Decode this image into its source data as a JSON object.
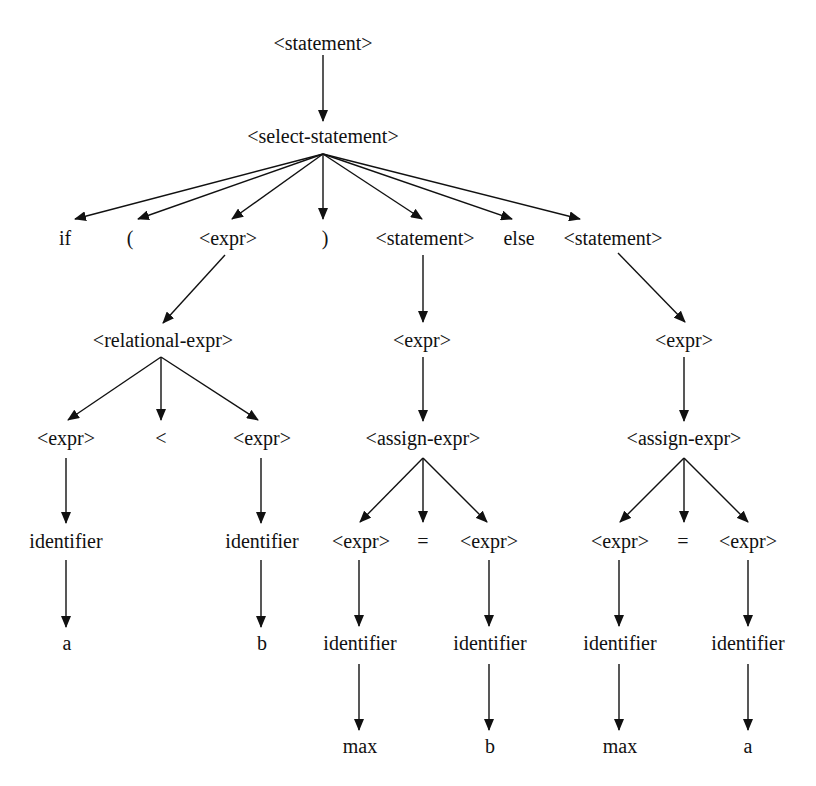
{
  "diagram": {
    "colors": {
      "line": "#111111",
      "text": "#111111",
      "background": "#ffffff"
    },
    "nodes": [
      {
        "id": "n0",
        "label": "<statement>",
        "x": 323,
        "y": 43
      },
      {
        "id": "n1",
        "label": "<select-statement>",
        "x": 323,
        "y": 136
      },
      {
        "id": "n2",
        "label": "if",
        "x": 65,
        "y": 238
      },
      {
        "id": "n3",
        "label": "(",
        "x": 130,
        "y": 238
      },
      {
        "id": "n4",
        "label": "<expr>",
        "x": 228,
        "y": 238
      },
      {
        "id": "n5",
        "label": ")",
        "x": 325,
        "y": 238
      },
      {
        "id": "n6",
        "label": "<statement>",
        "x": 425,
        "y": 238
      },
      {
        "id": "n7",
        "label": "else",
        "x": 519,
        "y": 238
      },
      {
        "id": "n8",
        "label": "<statement>",
        "x": 613,
        "y": 238
      },
      {
        "id": "n9",
        "label": "<relational-expr>",
        "x": 163,
        "y": 340
      },
      {
        "id": "n10",
        "label": "<expr>",
        "x": 422,
        "y": 340
      },
      {
        "id": "n11",
        "label": "<expr>",
        "x": 684,
        "y": 340
      },
      {
        "id": "n12",
        "label": "<expr>",
        "x": 66,
        "y": 438
      },
      {
        "id": "n13",
        "label": "<",
        "x": 161,
        "y": 438
      },
      {
        "id": "n14",
        "label": "<expr>",
        "x": 262,
        "y": 438
      },
      {
        "id": "n15",
        "label": "<assign-expr>",
        "x": 423,
        "y": 438
      },
      {
        "id": "n16",
        "label": "<assign-expr>",
        "x": 684,
        "y": 438
      },
      {
        "id": "n17",
        "label": "identifier",
        "x": 66,
        "y": 541
      },
      {
        "id": "n18",
        "label": "identifier",
        "x": 262,
        "y": 541
      },
      {
        "id": "n19",
        "label": "<expr>",
        "x": 361,
        "y": 541
      },
      {
        "id": "n20",
        "label": "=",
        "x": 423,
        "y": 541
      },
      {
        "id": "n21",
        "label": "<expr>",
        "x": 489,
        "y": 541
      },
      {
        "id": "n22",
        "label": "<expr>",
        "x": 620,
        "y": 541
      },
      {
        "id": "n23",
        "label": "=",
        "x": 683,
        "y": 541
      },
      {
        "id": "n24",
        "label": "<expr>",
        "x": 748,
        "y": 541
      },
      {
        "id": "n25",
        "label": "a",
        "x": 67,
        "y": 643
      },
      {
        "id": "n26",
        "label": "b",
        "x": 262,
        "y": 643
      },
      {
        "id": "n27",
        "label": "identifier",
        "x": 360,
        "y": 643
      },
      {
        "id": "n28",
        "label": "identifier",
        "x": 490,
        "y": 643
      },
      {
        "id": "n29",
        "label": "identifier",
        "x": 620,
        "y": 643
      },
      {
        "id": "n30",
        "label": "identifier",
        "x": 748,
        "y": 643
      },
      {
        "id": "n31",
        "label": "max",
        "x": 360,
        "y": 746
      },
      {
        "id": "n32",
        "label": "b",
        "x": 490,
        "y": 746
      },
      {
        "id": "n33",
        "label": "max",
        "x": 620,
        "y": 746
      },
      {
        "id": "n34",
        "label": "a",
        "x": 748,
        "y": 746
      }
    ],
    "edges": [
      {
        "from": "n0",
        "to": "n1",
        "x1": 323,
        "y1": 55,
        "x2": 323,
        "y2": 121
      },
      {
        "from": "n1",
        "to": "n2",
        "x1": 323,
        "y1": 154,
        "x2": 75,
        "y2": 219
      },
      {
        "from": "n1",
        "to": "n3",
        "x1": 323,
        "y1": 154,
        "x2": 138,
        "y2": 219
      },
      {
        "from": "n1",
        "to": "n4",
        "x1": 323,
        "y1": 154,
        "x2": 232,
        "y2": 219
      },
      {
        "from": "n1",
        "to": "n5",
        "x1": 323,
        "y1": 154,
        "x2": 323,
        "y2": 219
      },
      {
        "from": "n1",
        "to": "n6",
        "x1": 323,
        "y1": 154,
        "x2": 422,
        "y2": 219
      },
      {
        "from": "n1",
        "to": "n7",
        "x1": 323,
        "y1": 154,
        "x2": 512,
        "y2": 219
      },
      {
        "from": "n1",
        "to": "n8",
        "x1": 323,
        "y1": 154,
        "x2": 580,
        "y2": 219
      },
      {
        "from": "n4",
        "to": "n9",
        "x1": 225,
        "y1": 255,
        "x2": 163,
        "y2": 323
      },
      {
        "from": "n6",
        "to": "n10",
        "x1": 423,
        "y1": 255,
        "x2": 423,
        "y2": 322
      },
      {
        "from": "n8",
        "to": "n11",
        "x1": 618,
        "y1": 253,
        "x2": 685,
        "y2": 322
      },
      {
        "from": "n9",
        "to": "n12",
        "x1": 161,
        "y1": 357,
        "x2": 68,
        "y2": 420
      },
      {
        "from": "n9",
        "to": "n13",
        "x1": 161,
        "y1": 357,
        "x2": 161,
        "y2": 420
      },
      {
        "from": "n9",
        "to": "n14",
        "x1": 161,
        "y1": 357,
        "x2": 258,
        "y2": 420
      },
      {
        "from": "n10",
        "to": "n15",
        "x1": 423,
        "y1": 357,
        "x2": 423,
        "y2": 421
      },
      {
        "from": "n11",
        "to": "n16",
        "x1": 684,
        "y1": 357,
        "x2": 684,
        "y2": 421
      },
      {
        "from": "n12",
        "to": "n17",
        "x1": 66,
        "y1": 458,
        "x2": 66,
        "y2": 523
      },
      {
        "from": "n14",
        "to": "n18",
        "x1": 261,
        "y1": 458,
        "x2": 261,
        "y2": 523
      },
      {
        "from": "n15",
        "to": "n19",
        "x1": 423,
        "y1": 458,
        "x2": 360,
        "y2": 522
      },
      {
        "from": "n15",
        "to": "n20",
        "x1": 423,
        "y1": 458,
        "x2": 423,
        "y2": 522
      },
      {
        "from": "n15",
        "to": "n21",
        "x1": 423,
        "y1": 458,
        "x2": 487,
        "y2": 522
      },
      {
        "from": "n16",
        "to": "n22",
        "x1": 684,
        "y1": 458,
        "x2": 620,
        "y2": 522
      },
      {
        "from": "n16",
        "to": "n23",
        "x1": 684,
        "y1": 458,
        "x2": 684,
        "y2": 522
      },
      {
        "from": "n16",
        "to": "n24",
        "x1": 684,
        "y1": 458,
        "x2": 748,
        "y2": 522
      },
      {
        "from": "n17",
        "to": "n25",
        "x1": 66,
        "y1": 560,
        "x2": 66,
        "y2": 627
      },
      {
        "from": "n18",
        "to": "n26",
        "x1": 261,
        "y1": 560,
        "x2": 261,
        "y2": 627
      },
      {
        "from": "n19",
        "to": "n27",
        "x1": 359,
        "y1": 560,
        "x2": 359,
        "y2": 626
      },
      {
        "from": "n21",
        "to": "n28",
        "x1": 489,
        "y1": 560,
        "x2": 489,
        "y2": 626
      },
      {
        "from": "n22",
        "to": "n29",
        "x1": 619,
        "y1": 560,
        "x2": 619,
        "y2": 626
      },
      {
        "from": "n24",
        "to": "n30",
        "x1": 748,
        "y1": 560,
        "x2": 748,
        "y2": 626
      },
      {
        "from": "n27",
        "to": "n31",
        "x1": 359,
        "y1": 664,
        "x2": 359,
        "y2": 730
      },
      {
        "from": "n28",
        "to": "n32",
        "x1": 489,
        "y1": 664,
        "x2": 489,
        "y2": 730
      },
      {
        "from": "n29",
        "to": "n33",
        "x1": 619,
        "y1": 664,
        "x2": 619,
        "y2": 730
      },
      {
        "from": "n30",
        "to": "n34",
        "x1": 748,
        "y1": 664,
        "x2": 748,
        "y2": 730
      }
    ]
  }
}
